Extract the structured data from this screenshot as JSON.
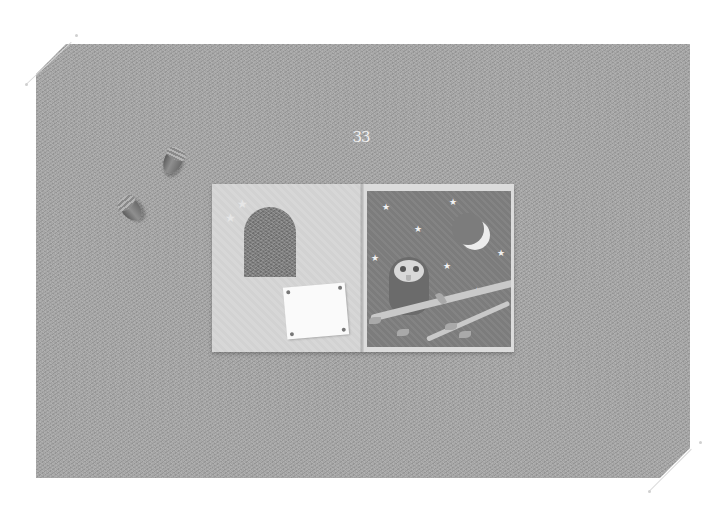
{
  "scene": {
    "description": "Photograph of an open children's picture book lying on grey felt with two acorns",
    "background_color": "#a4a4a4",
    "page_number": "33"
  },
  "book": {
    "left_page": {
      "elements": [
        "two stars",
        "arched window cut-out",
        "white note pinned at four corners"
      ],
      "color": "#d2d2d2"
    },
    "right_page": {
      "elements": [
        "night sky",
        "crescent moon",
        "stars",
        "owl",
        "branch with leaves"
      ],
      "panel_color": "#7c7c7c"
    }
  },
  "props": [
    {
      "name": "acorn",
      "count": 2
    }
  ]
}
